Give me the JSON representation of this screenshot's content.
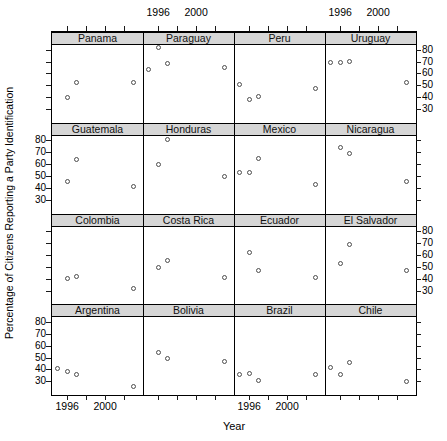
{
  "figure": {
    "width": 447,
    "height": 441,
    "background": "#ffffff"
  },
  "style": {
    "strip_bg": "#d6d6d6",
    "border_color": "#000000",
    "point_color": "#4d4d4d",
    "text_color": "#000000"
  },
  "chart_data": {
    "type": "scatter",
    "title": "",
    "xlabel": "Year",
    "ylabel": "Percentage of Citizens Reporting a Party Identification",
    "grid": {
      "rows": 4,
      "cols": 4
    },
    "x_range": [
      1994.4,
      2004.0
    ],
    "y_range": [
      18.5,
      83.9
    ],
    "x_ticks": [
      1996,
      1998,
      2000,
      2002
    ],
    "x_labeled_ticks": [
      1996,
      2000
    ],
    "y_ticks": [
      30,
      40,
      50,
      60,
      70,
      80
    ],
    "top_labeled_columns": [
      2,
      4
    ],
    "bottom_labeled_columns": [
      1,
      3
    ],
    "right_labeled_rows": [
      1,
      3
    ],
    "left_labeled_rows": [
      2,
      4
    ],
    "panels": [
      {
        "country": "Panama",
        "points": [
          {
            "year": 1996,
            "value": 40
          },
          {
            "year": 1997,
            "value": 52
          },
          {
            "year": 2003,
            "value": 52
          }
        ]
      },
      {
        "country": "Paraguay",
        "points": [
          {
            "year": 1995,
            "value": 63
          },
          {
            "year": 1996,
            "value": 82
          },
          {
            "year": 1997,
            "value": 68
          },
          {
            "year": 2003,
            "value": 65
          }
        ]
      },
      {
        "country": "Peru",
        "points": [
          {
            "year": 1995,
            "value": 51
          },
          {
            "year": 1996,
            "value": 38
          },
          {
            "year": 1997,
            "value": 41
          },
          {
            "year": 2003,
            "value": 47
          }
        ]
      },
      {
        "country": "Uruguay",
        "points": [
          {
            "year": 1995,
            "value": 69
          },
          {
            "year": 1996,
            "value": 69
          },
          {
            "year": 1997,
            "value": 70
          },
          {
            "year": 2003,
            "value": 52
          }
        ]
      },
      {
        "country": "Guatemala",
        "points": [
          {
            "year": 1996,
            "value": 45
          },
          {
            "year": 1997,
            "value": 64
          },
          {
            "year": 2003,
            "value": 41
          }
        ]
      },
      {
        "country": "Honduras",
        "points": [
          {
            "year": 1996,
            "value": 60
          },
          {
            "year": 1997,
            "value": 81
          },
          {
            "year": 2003,
            "value": 50
          }
        ]
      },
      {
        "country": "Mexico",
        "points": [
          {
            "year": 1995,
            "value": 53
          },
          {
            "year": 1996,
            "value": 53
          },
          {
            "year": 1997,
            "value": 65
          },
          {
            "year": 2003,
            "value": 43
          }
        ]
      },
      {
        "country": "Nicaragua",
        "points": [
          {
            "year": 1996,
            "value": 74
          },
          {
            "year": 1997,
            "value": 69
          },
          {
            "year": 2003,
            "value": 45
          }
        ]
      },
      {
        "country": "Colombia",
        "points": [
          {
            "year": 1996,
            "value": 40
          },
          {
            "year": 1997,
            "value": 42
          },
          {
            "year": 2003,
            "value": 32
          }
        ]
      },
      {
        "country": "Costa Rica",
        "points": [
          {
            "year": 1996,
            "value": 49
          },
          {
            "year": 1997,
            "value": 55
          },
          {
            "year": 2003,
            "value": 41
          }
        ]
      },
      {
        "country": "Ecuador",
        "points": [
          {
            "year": 1996,
            "value": 62
          },
          {
            "year": 1997,
            "value": 47
          },
          {
            "year": 2003,
            "value": 41
          }
        ]
      },
      {
        "country": "El Salvador",
        "points": [
          {
            "year": 1996,
            "value": 53
          },
          {
            "year": 1997,
            "value": 69
          },
          {
            "year": 2003,
            "value": 47
          }
        ]
      },
      {
        "country": "Argentina",
        "points": [
          {
            "year": 1995,
            "value": 41
          },
          {
            "year": 1996,
            "value": 38
          },
          {
            "year": 1997,
            "value": 36
          },
          {
            "year": 2003,
            "value": 26
          }
        ]
      },
      {
        "country": "Bolivia",
        "points": [
          {
            "year": 1996,
            "value": 54
          },
          {
            "year": 1997,
            "value": 49
          },
          {
            "year": 2003,
            "value": 47
          }
        ]
      },
      {
        "country": "Brazil",
        "points": [
          {
            "year": 1995,
            "value": 36
          },
          {
            "year": 1996,
            "value": 37
          },
          {
            "year": 1997,
            "value": 31
          },
          {
            "year": 2003,
            "value": 36
          }
        ]
      },
      {
        "country": "Chile",
        "points": [
          {
            "year": 1995,
            "value": 42
          },
          {
            "year": 1996,
            "value": 36
          },
          {
            "year": 1997,
            "value": 46
          },
          {
            "year": 2003,
            "value": 30
          }
        ]
      }
    ]
  }
}
